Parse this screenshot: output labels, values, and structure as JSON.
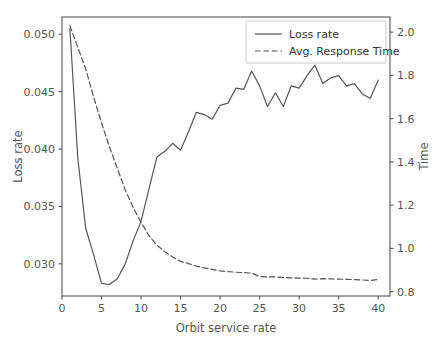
{
  "chart_data": {
    "type": "line",
    "title": "",
    "xlabel": "Orbit service rate",
    "ylabel": "Loss rate",
    "y2label": "Time",
    "xlim": [
      0,
      41.5
    ],
    "ylim": [
      0.0272,
      0.0515
    ],
    "y2lim": [
      0.78,
      2.07
    ],
    "xticks": [
      0,
      5,
      10,
      15,
      20,
      25,
      30,
      35,
      40
    ],
    "xticklabels": [
      "0",
      "5",
      "10",
      "15",
      "20",
      "25",
      "30",
      "35",
      "40"
    ],
    "yticks": [
      0.03,
      0.035,
      0.04,
      0.045,
      0.05
    ],
    "yticklabels": [
      "0.030",
      "0.035",
      "0.040",
      "0.045",
      "0.050"
    ],
    "y2ticks": [
      0.8,
      1.0,
      1.2,
      1.4,
      1.6,
      1.8,
      2.0
    ],
    "y2ticklabels": [
      "0.8",
      "1.0",
      "1.2",
      "1.4",
      "1.6",
      "1.8",
      "2.0"
    ],
    "grid": false,
    "legend_position": "upper right",
    "line_color": "#555555",
    "x": [
      1,
      2,
      3,
      4,
      5,
      6,
      7,
      8,
      9,
      10,
      11,
      12,
      13,
      14,
      15,
      16,
      17,
      18,
      19,
      20,
      21,
      22,
      23,
      24,
      25,
      26,
      27,
      28,
      29,
      30,
      31,
      32,
      33,
      34,
      35,
      36,
      37,
      38,
      39,
      40
    ],
    "series": [
      {
        "name": "Loss rate",
        "axis": "left",
        "style": "solid",
        "values": [
          0.0505,
          0.0392,
          0.0331,
          0.0308,
          0.0283,
          0.0282,
          0.0287,
          0.03,
          0.032,
          0.0337,
          0.0365,
          0.0393,
          0.0398,
          0.0405,
          0.0399,
          0.0415,
          0.0432,
          0.043,
          0.0426,
          0.0438,
          0.044,
          0.0453,
          0.0452,
          0.0468,
          0.0455,
          0.0437,
          0.0449,
          0.0437,
          0.0455,
          0.0453,
          0.0464,
          0.0473,
          0.0457,
          0.0462,
          0.0464,
          0.0455,
          0.0457,
          0.0448,
          0.0444,
          0.046
        ]
      },
      {
        "name": "Avg. Response Time",
        "axis": "right",
        "style": "dashed",
        "values": [
          2.03,
          1.93,
          1.83,
          1.7,
          1.58,
          1.47,
          1.37,
          1.27,
          1.19,
          1.12,
          1.06,
          1.015,
          0.985,
          0.96,
          0.94,
          0.93,
          0.918,
          0.91,
          0.903,
          0.896,
          0.893,
          0.89,
          0.888,
          0.886,
          0.87,
          0.868,
          0.868,
          0.866,
          0.864,
          0.863,
          0.862,
          0.858,
          0.86,
          0.859,
          0.858,
          0.857,
          0.856,
          0.854,
          0.852,
          0.857
        ]
      }
    ],
    "legend": [
      {
        "label": "Loss rate",
        "style": "solid"
      },
      {
        "label": "Avg. Response Time",
        "style": "dashed"
      }
    ]
  }
}
